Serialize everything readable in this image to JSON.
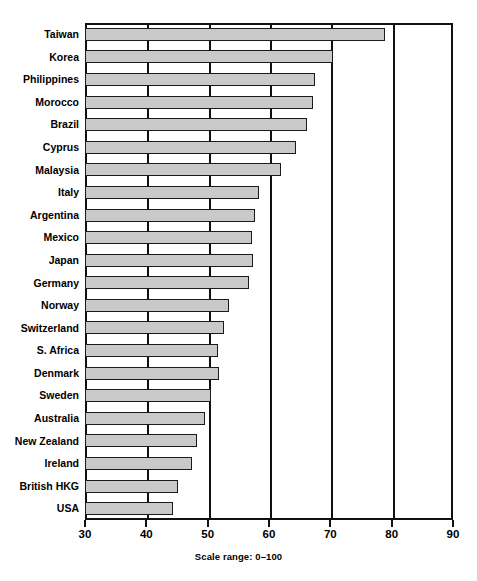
{
  "chart_data": {
    "type": "bar",
    "orientation": "horizontal",
    "title": "",
    "subtitle": "",
    "xlabel": "",
    "ylabel": "",
    "caption": "Scale range: 0–100",
    "xlim": [
      30,
      90
    ],
    "xticks": [
      30,
      40,
      50,
      60,
      70,
      80,
      90
    ],
    "xtick_labels": [
      "30",
      "40",
      "50",
      "60",
      "70",
      "80",
      "90"
    ],
    "grid": true,
    "grid_axis": "x",
    "legend": false,
    "bar_fill_color": "#c9c9c9",
    "bar_border_color": "#1a1a1a",
    "axis_color": "#111111",
    "background_color": "#ffffff",
    "categories": [
      "Taiwan",
      "Korea",
      "Philippines",
      "Morocco",
      "Brazil",
      "Cyprus",
      "Malaysia",
      "Italy",
      "Argentina",
      "Mexico",
      "Japan",
      "Germany",
      "Norway",
      "Switzerland",
      "S. Africa",
      "Denmark",
      "Sweden",
      "Australia",
      "New Zealand",
      "Ireland",
      "British HKG",
      "USA"
    ],
    "values": [
      78.9,
      70.4,
      67.5,
      67.2,
      66.2,
      64.4,
      61.9,
      58.4,
      57.7,
      57.2,
      57.4,
      56.7,
      53.5,
      52.7,
      51.7,
      51.9,
      50.5,
      49.6,
      48.3,
      47.4,
      45.2,
      44.4
    ]
  }
}
